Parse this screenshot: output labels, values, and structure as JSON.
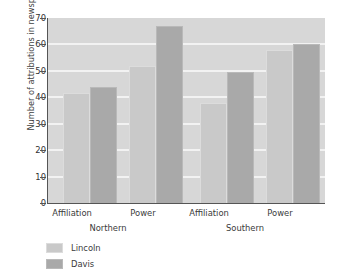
{
  "chart_data": {
    "type": "bar",
    "title": "",
    "xlabel": "",
    "ylabel": "Number of attributions in newspaper stories",
    "ylim": [
      0,
      70
    ],
    "yticks": [
      0,
      10,
      20,
      30,
      40,
      50,
      60,
      70
    ],
    "grid": true,
    "legend_position": "below-left",
    "groups": [
      {
        "name": "Northern",
        "categories": [
          "Affiliation",
          "Power"
        ]
      },
      {
        "name": "Southern",
        "categories": [
          "Affiliation",
          "Power"
        ]
      }
    ],
    "categories": [
      "Affiliation",
      "Power",
      "Affiliation",
      "Power"
    ],
    "series": [
      {
        "name": "Lincoln",
        "color": "#c9c9c9",
        "values": [
          41.5,
          52,
          38,
          58
        ]
      },
      {
        "name": "Davis",
        "color": "#a9a9a9",
        "values": [
          44,
          67,
          49.5,
          60
        ]
      }
    ],
    "bars": [
      {
        "group": "Northern",
        "category": "Affiliation",
        "series": "Lincoln",
        "value": 41.5
      },
      {
        "group": "Northern",
        "category": "Affiliation",
        "series": "Davis",
        "value": 44
      },
      {
        "group": "Northern",
        "category": "Power",
        "series": "Lincoln",
        "value": 52
      },
      {
        "group": "Northern",
        "category": "Power",
        "series": "Davis",
        "value": 67
      },
      {
        "group": "Southern",
        "category": "Affiliation",
        "series": "Lincoln",
        "value": 38
      },
      {
        "group": "Southern",
        "category": "Affiliation",
        "series": "Davis",
        "value": 49.5
      },
      {
        "group": "Southern",
        "category": "Power",
        "series": "Lincoln",
        "value": 58
      },
      {
        "group": "Southern",
        "category": "Power",
        "series": "Davis",
        "value": 60
      }
    ],
    "plot_background": "#d7d7d7",
    "gridline_color": "#f2f2f2"
  },
  "axis": {
    "y_title": "Number of attributions in newspaper stories",
    "y_tick_labels": [
      "70",
      "60",
      "50",
      "40",
      "30",
      "20",
      "10",
      "0"
    ]
  },
  "categories": {
    "north_affiliation": "Affiliation",
    "north_power": "Power",
    "south_affiliation": "Affiliation",
    "south_power": "Power",
    "northern": "Northern",
    "southern": "Southern"
  },
  "legend": {
    "items": [
      {
        "label": "Lincoln",
        "color": "#c9c9c9"
      },
      {
        "label": "Davis",
        "color": "#a9a9a9"
      }
    ]
  }
}
